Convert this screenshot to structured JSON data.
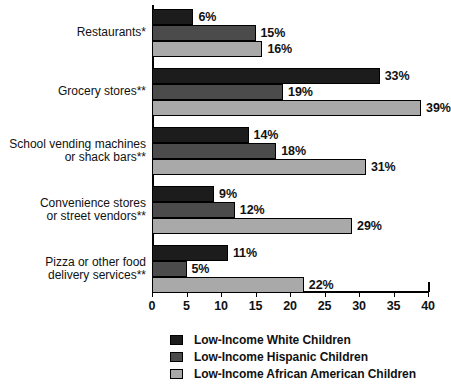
{
  "chart_data": {
    "type": "bar",
    "orientation": "horizontal",
    "title": "",
    "xlabel": "",
    "ylabel": "",
    "xlim": [
      0,
      40
    ],
    "xticks": [
      0,
      5,
      10,
      15,
      20,
      25,
      30,
      35,
      40
    ],
    "xtick_labels": [
      "0",
      "5",
      "10",
      "15",
      "20",
      "25",
      "30",
      "35",
      "40"
    ],
    "grid": false,
    "value_suffix": "%",
    "legend_position": "bottom",
    "categories": [
      "Restaurants*",
      "Grocery stores**",
      "School vending machines\nor shack bars**",
      "Convenience stores\nor street vendors**",
      "Pizza or other food\ndelivery services**"
    ],
    "series": [
      {
        "name": "Low-Income White Children",
        "color": "#1c1c1c",
        "values": [
          6,
          33,
          14,
          9,
          11
        ],
        "labels": [
          "6%",
          "33%",
          "14%",
          "9%",
          "11%"
        ]
      },
      {
        "name": "Low-Income Hispanic Children",
        "color": "#4b4b4b",
        "values": [
          15,
          19,
          18,
          12,
          5
        ],
        "labels": [
          "15%",
          "19%",
          "18%",
          "12%",
          "5%"
        ]
      },
      {
        "name": "Low-Income African American Children",
        "color": "#a9a9a9",
        "values": [
          16,
          39,
          31,
          29,
          22
        ],
        "labels": [
          "16%",
          "39%",
          "31%",
          "29%",
          "22%"
        ]
      }
    ]
  },
  "legend": {
    "items": [
      {
        "label": "Low-Income White Children",
        "swatch": "s0"
      },
      {
        "label": "Low-Income Hispanic Children",
        "swatch": "s1"
      },
      {
        "label": "Low-Income African American Children",
        "swatch": "s2"
      }
    ]
  },
  "colors": {
    "series_white": "#1c1c1c",
    "series_hispanic": "#4b4b4b",
    "series_african_american": "#a9a9a9",
    "axis": "#000000",
    "text": "#111111",
    "background": "#ffffff"
  }
}
